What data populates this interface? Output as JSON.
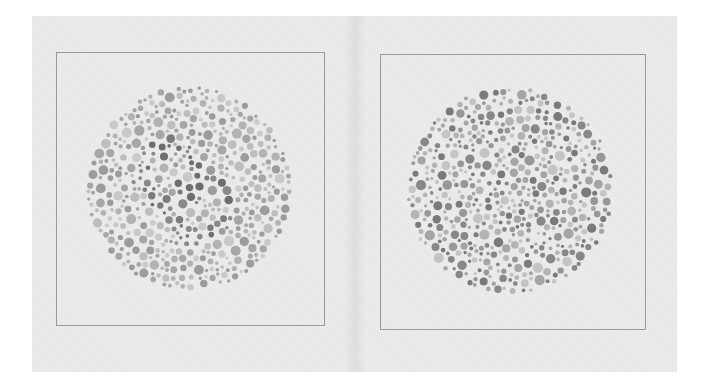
{
  "spread": {
    "background": "#ebebeb",
    "frame_color": "#9a9a9a"
  },
  "plates": [
    {
      "name": "plate-left",
      "frame": {
        "x": 56,
        "y": 52,
        "w": 269,
        "h": 274
      },
      "circle": {
        "cx": 189,
        "cy": 188,
        "r": 103
      },
      "seed": 17,
      "figure_shade": "dark",
      "palette": [
        "#c9c9c9",
        "#bdbdbd",
        "#b2b2b2",
        "#a6a6a6",
        "#9c9c9c"
      ],
      "figure_palette": [
        "#8a8a8a",
        "#7b7b7b",
        "#6e6e6e"
      ]
    },
    {
      "name": "plate-right",
      "frame": {
        "x": 380,
        "y": 54,
        "w": 266,
        "h": 276
      },
      "circle": {
        "cx": 510,
        "cy": 190,
        "r": 104
      },
      "seed": 53,
      "figure_shade": "none",
      "palette": [
        "#c4c4c4",
        "#b4b4b4",
        "#a5a5a5",
        "#979797",
        "#888888",
        "#7a7a7a"
      ],
      "figure_palette": []
    }
  ]
}
